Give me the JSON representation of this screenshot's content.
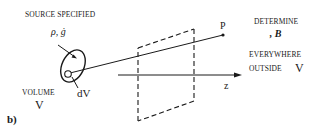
{
  "figure": {
    "panel_label": "b)",
    "source_label": "SOURCE  SPECIFIED",
    "source_quantities": "ρ,  ġ",
    "volume_label": "VOLUME",
    "volume_symbol": "V",
    "element_label": "dV",
    "point_label": "P",
    "axis_label": "z",
    "determine_label": "DETERMINE",
    "fields_label": "ℰ,  B⃗",
    "everywhere_label": "EVERYWHERE",
    "outside_label": "OUTSIDE",
    "outside_symbol": "V"
  },
  "colors": {
    "ink": "#1a1a1a",
    "background": "#ffffff"
  }
}
